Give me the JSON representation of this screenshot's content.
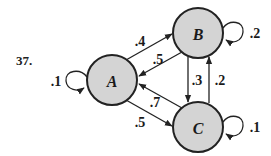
{
  "problem_number": "37.",
  "nodes": [
    {
      "id": "A",
      "label": "A",
      "fill": "#d4d4d4"
    },
    {
      "id": "B",
      "label": "B",
      "fill": "#d4d4d4"
    },
    {
      "id": "C",
      "label": "C",
      "fill": "#d4d4d4"
    }
  ],
  "edges": [
    {
      "from": "A",
      "to": "A",
      "label": ".1"
    },
    {
      "from": "A",
      "to": "B",
      "label": ".4"
    },
    {
      "from": "B",
      "to": "A",
      "label": ".5"
    },
    {
      "from": "B",
      "to": "B",
      "label": ".2"
    },
    {
      "from": "B",
      "to": "C",
      "label": ".3"
    },
    {
      "from": "C",
      "to": "B",
      "label": ".2"
    },
    {
      "from": "C",
      "to": "A",
      "label": ".7"
    },
    {
      "from": "A",
      "to": "C",
      "label": ".5"
    },
    {
      "from": "C",
      "to": "C",
      "label": ".1"
    }
  ],
  "colors": {
    "node_fill": "#d4d4d4",
    "stroke": "#222222",
    "text": "#1a1a1a"
  }
}
